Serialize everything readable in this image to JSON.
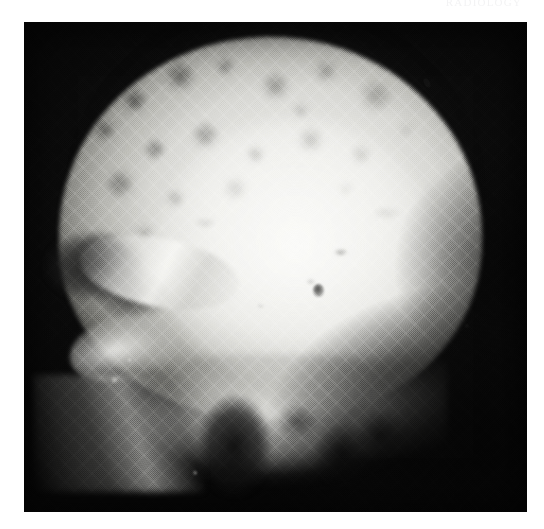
{
  "page": {
    "background_color": "#ffffff",
    "width": 544,
    "height": 529,
    "ghost_text": "RADIOLOGY"
  },
  "figure": {
    "name": "lateral-skull-radiograph",
    "modality": "X-ray radiograph",
    "view": "lateral skull",
    "print_style": "halftone screened black-and-white reproduction",
    "plate": {
      "left": 24,
      "top": 22,
      "width": 503,
      "height": 490,
      "border_color": "#0a0a0a",
      "background_color": "#0a0a0a"
    },
    "tones": {
      "film_black": "#090909",
      "bone_bright": "#f2f2f0",
      "bone_mid": "#b9b9b4",
      "soft_tissue_halo": "#b4b4b2",
      "artifact_speck": "#121212"
    },
    "features": [
      {
        "name": "cranial-vault",
        "description": "Large bright rounded calvarium occupying the upper two-thirds of the plate"
      },
      {
        "name": "mottled-lytic-texture",
        "description": "Coarse moth-eaten patchy lucencies over the frontal and parietal vault"
      },
      {
        "name": "orbital-sinus-complex",
        "description": "Dark air-containing orbital and frontal sinus region at the anterior (left) skull"
      },
      {
        "name": "sphenoid-ridge",
        "description": "Bright oblique sclerotic streak crossing the anterior skull base"
      },
      {
        "name": "petrous-ridge",
        "description": "Bright wedge-shaped dense bone below and behind the orbit"
      },
      {
        "name": "skull-base-facial-bones",
        "description": "Bright dense mass of facial bones and skull base along the lower margin"
      },
      {
        "name": "nasopharyngeal-air-space",
        "description": "Dark vertical lucent column within the skull base"
      },
      {
        "name": "mandibular-ramus",
        "description": "Bright oblique streak in the lower anterior dark field"
      },
      {
        "name": "central-nodule",
        "description": "Small discrete gray nodular density near the centre of the vault"
      },
      {
        "name": "ink-speck-artifact",
        "description": "Small dark ink fleck on the superior-posterior skull margin"
      },
      {
        "name": "posterior-dark-field",
        "description": "Deep black unexposed film region behind and below the occiput"
      }
    ]
  }
}
